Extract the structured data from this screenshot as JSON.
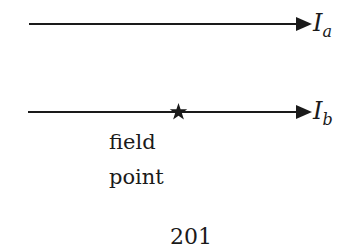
{
  "diagram": {
    "wires": [
      {
        "id": "a",
        "current_label": "I",
        "subscript": "a",
        "direction": "right"
      },
      {
        "id": "b",
        "current_label": "I",
        "subscript": "b",
        "direction": "right"
      }
    ],
    "field_point": {
      "marker": "★",
      "label_line1": "field",
      "label_line2": "point"
    },
    "page_number": "201",
    "colors": {
      "ink": "#1a1a1a",
      "background": "#ffffff"
    }
  }
}
